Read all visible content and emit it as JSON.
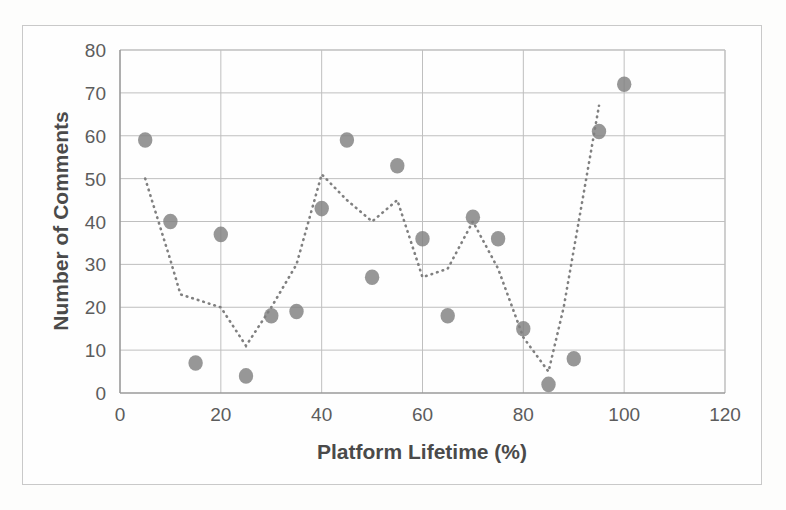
{
  "chart_data": {
    "type": "scatter",
    "title": "",
    "xlabel": "Platform Lifetime (%)",
    "ylabel": "Number of Comments",
    "xlim": [
      0,
      120
    ],
    "ylim": [
      0,
      80
    ],
    "xticks": [
      0,
      20,
      40,
      60,
      80,
      100,
      120
    ],
    "yticks": [
      0,
      10,
      20,
      30,
      40,
      50,
      60,
      70,
      80
    ],
    "grid": true,
    "legend": "none",
    "marker_color": "#808080",
    "grid_color": "#bfbfbf",
    "series": [
      {
        "name": "Comments per platform lifetime bin",
        "type": "scatter",
        "marker": "circle",
        "points": [
          {
            "x": 5,
            "y": 59
          },
          {
            "x": 10,
            "y": 40
          },
          {
            "x": 15,
            "y": 7
          },
          {
            "x": 20,
            "y": 37
          },
          {
            "x": 25,
            "y": 4
          },
          {
            "x": 30,
            "y": 18
          },
          {
            "x": 35,
            "y": 19
          },
          {
            "x": 40,
            "y": 43
          },
          {
            "x": 45,
            "y": 59
          },
          {
            "x": 50,
            "y": 27
          },
          {
            "x": 55,
            "y": 53
          },
          {
            "x": 60,
            "y": 36
          },
          {
            "x": 65,
            "y": 18
          },
          {
            "x": 70,
            "y": 41
          },
          {
            "x": 75,
            "y": 36
          },
          {
            "x": 80,
            "y": 15
          },
          {
            "x": 85,
            "y": 2
          },
          {
            "x": 90,
            "y": 8
          },
          {
            "x": 95,
            "y": 61
          },
          {
            "x": 100,
            "y": 72
          }
        ]
      },
      {
        "name": "Trend line",
        "type": "line",
        "style": "dotted",
        "points": [
          {
            "x": 5,
            "y": 50
          },
          {
            "x": 10,
            "y": 31
          },
          {
            "x": 12,
            "y": 23
          },
          {
            "x": 20,
            "y": 20
          },
          {
            "x": 25,
            "y": 11
          },
          {
            "x": 30,
            "y": 20
          },
          {
            "x": 35,
            "y": 30
          },
          {
            "x": 40,
            "y": 51
          },
          {
            "x": 45,
            "y": 45
          },
          {
            "x": 50,
            "y": 40
          },
          {
            "x": 55,
            "y": 45
          },
          {
            "x": 60,
            "y": 27
          },
          {
            "x": 65,
            "y": 29
          },
          {
            "x": 70,
            "y": 40
          },
          {
            "x": 75,
            "y": 29
          },
          {
            "x": 80,
            "y": 13
          },
          {
            "x": 85,
            "y": 5
          },
          {
            "x": 88,
            "y": 20
          },
          {
            "x": 95,
            "y": 67
          }
        ]
      }
    ]
  },
  "axes": {
    "x_tick_labels": [
      "0",
      "20",
      "40",
      "60",
      "80",
      "100",
      "120"
    ],
    "y_tick_labels": [
      "0",
      "10",
      "20",
      "30",
      "40",
      "50",
      "60",
      "70",
      "80"
    ],
    "x_axis_title": "Platform Lifetime (%)",
    "y_axis_title": "Number of Comments"
  },
  "colors": {
    "marker": "#808080",
    "gridline": "#bfbfbf",
    "axis_line": "#9a9a9a",
    "frame": "#c9c9c9",
    "text": "#5c5c5c",
    "title_text": "#4a4a4a",
    "background": "#fdfdfc"
  }
}
